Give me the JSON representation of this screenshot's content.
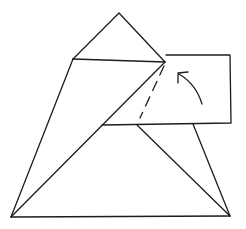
{
  "diagram": {
    "type": "origami-fold-step",
    "stroke_color": "#1c1c1c",
    "background": "#ffffff",
    "shapes": {
      "top_triangle": [
        [
          73,
          59
        ],
        [
          119,
          13
        ],
        [
          165,
          62
        ]
      ],
      "left_flap": [
        [
          73,
          59
        ],
        [
          165,
          62
        ],
        [
          11,
          217
        ]
      ],
      "trapezoid_left_edge": [
        [
          73,
          59
        ],
        [
          11,
          217
        ]
      ],
      "folded_rectangle": [
        [
          166,
          55
        ],
        [
          230,
          55
        ],
        [
          231,
          123
        ],
        [
          102,
          125
        ]
      ],
      "rect_top_edge": [
        [
          166,
          55
        ],
        [
          230,
          55
        ]
      ],
      "rect_right_edge": [
        [
          230,
          55
        ],
        [
          231,
          123
        ]
      ],
      "rect_bottom_edge": [
        [
          102,
          125
        ],
        [
          231,
          123
        ]
      ],
      "diagonal_main": [
        [
          165,
          62
        ],
        [
          11,
          217
        ]
      ],
      "lower_inner_line": [
        [
          137,
          125
        ],
        [
          230,
          216
        ]
      ],
      "lower_right_edge": [
        [
          193,
          124
        ],
        [
          230,
          216
        ]
      ],
      "base_edge": [
        [
          11,
          217
        ],
        [
          230,
          216
        ]
      ]
    },
    "fold_line": {
      "style": "dashed",
      "from": [
        165,
        63
      ],
      "to": [
        140,
        118
      ]
    },
    "arrow": {
      "type": "curved-fold-arrow",
      "from": [
        202,
        104
      ],
      "to": [
        178,
        73
      ],
      "direction": "up-left"
    }
  }
}
